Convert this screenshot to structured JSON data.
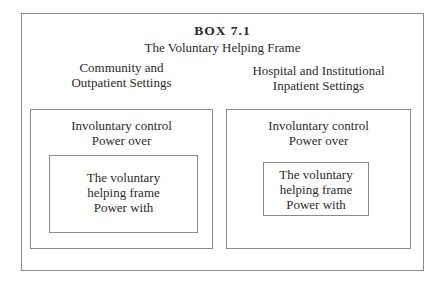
{
  "box": {
    "label": "BOX 7.1",
    "title": "The Voluntary Helping Frame",
    "left": {
      "heading": "Community and\nOutpatient Settings",
      "outer_text": "Involuntary control\nPower over",
      "inner_text": "The voluntary\nhelping frame\nPower with"
    },
    "right": {
      "heading": "Hospital and Institutional\nInpatient Settings",
      "outer_text": "Involuntary control\nPower over",
      "inner_text": "The voluntary\nhelping frame\nPower with"
    }
  }
}
